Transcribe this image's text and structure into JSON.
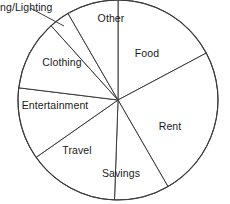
{
  "chart_data": {
    "type": "pie",
    "title": "",
    "subtitle": "",
    "xlabel": "",
    "ylabel": "",
    "legend_position": "none",
    "grid": false,
    "labels_inside_slices": true,
    "note_clipped_label": "The Heating/Lighting label is cut off at the left edge of the image and renders as 'ng/Lighting'.",
    "categories": [
      "Food",
      "Rent",
      "Savings",
      "Travel",
      "Entertainment",
      "Clothing",
      "Heating/Lighting",
      "Other"
    ],
    "values": [
      17,
      24,
      9,
      15,
      12,
      11,
      4,
      8
    ],
    "units": "percent",
    "slices": [
      {
        "label": "Food",
        "display_label": "Food",
        "value": 17,
        "start_angle": 0,
        "end_angle": 62,
        "label_x": 147,
        "label_y": 53,
        "external": false
      },
      {
        "label": "Rent",
        "display_label": "Rent",
        "value": 24,
        "start_angle": 62,
        "end_angle": 150,
        "label_x": 170,
        "label_y": 126,
        "external": false
      },
      {
        "label": "Savings",
        "display_label": "Savings",
        "value": 9,
        "start_angle": 150,
        "end_angle": 182,
        "label_x": 121,
        "label_y": 173,
        "external": false
      },
      {
        "label": "Travel",
        "display_label": "Travel",
        "value": 15,
        "start_angle": 182,
        "end_angle": 235,
        "label_x": 77,
        "label_y": 150,
        "external": false
      },
      {
        "label": "Entertainment",
        "display_label": "Entertainment",
        "value": 12,
        "start_angle": 235,
        "end_angle": 277,
        "label_x": 55,
        "label_y": 105,
        "external": false
      },
      {
        "label": "Clothing",
        "display_label": "Clothing",
        "value": 11,
        "start_angle": 277,
        "end_angle": 318,
        "label_x": 62,
        "label_y": 62,
        "external": false
      },
      {
        "label": "Heating/Lighting",
        "display_label": "ng/Lighting",
        "value": 4,
        "start_angle": 318,
        "end_angle": 330,
        "label_x": 0,
        "label_y": 2,
        "external": true
      },
      {
        "label": "Other",
        "display_label": "Other",
        "value": 8,
        "start_angle": 330,
        "end_angle": 360,
        "label_x": 111,
        "label_y": 18,
        "external": false
      }
    ],
    "geometry": {
      "center_x": 118,
      "center_y": 100,
      "radius": 100,
      "clipped_top": true
    },
    "colors": {
      "slice_fill": "#ffffff",
      "slice_stroke": "#3b3b3b",
      "background": "#ffffff",
      "text": "#1a1a1a"
    }
  }
}
